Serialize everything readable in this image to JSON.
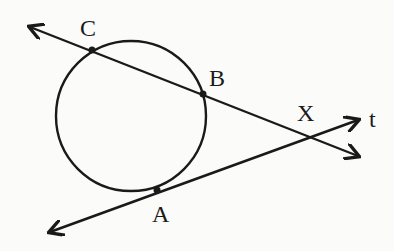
{
  "diagram": {
    "type": "circle with secant and tangent lines",
    "stroke_color": "#1a1a1a",
    "background": "#fbfbfa",
    "circle": {
      "cx": 131,
      "cy": 116,
      "r": 75
    },
    "points": {
      "C": {
        "label": "C",
        "x": 92,
        "y": 50
      },
      "B": {
        "label": "B",
        "x": 203,
        "y": 94
      },
      "A": {
        "label": "A",
        "x": 157,
        "y": 190
      },
      "X": {
        "label": "X",
        "x": 307,
        "y": 137
      }
    },
    "lines": {
      "secant": {
        "from": [
          30,
          27
        ],
        "to": [
          358,
          156
        ],
        "through": [
          "C",
          "B",
          "X"
        ]
      },
      "tangent": {
        "label": "t",
        "from": [
          50,
          232
        ],
        "to": [
          358,
          120
        ],
        "through": [
          "A",
          "X"
        ]
      }
    },
    "labels": {
      "C": "C",
      "B": "B",
      "A": "A",
      "X": "X",
      "t": "t"
    }
  }
}
